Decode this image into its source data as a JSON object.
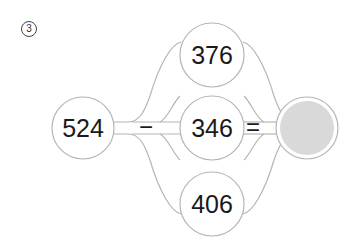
{
  "problem": {
    "number_label": "3",
    "minuend": "524",
    "operator_minus": "−",
    "operator_equals": "=",
    "subtrahend_options": [
      {
        "label": "376",
        "position": "top"
      },
      {
        "label": "346",
        "position": "middle"
      },
      {
        "label": "406",
        "position": "bottom"
      }
    ],
    "answer": ""
  },
  "colors": {
    "outline": "#b5b5b5",
    "answer_fill": "#d9d9d9",
    "text": "#1a1a1a",
    "background": "#ffffff"
  }
}
